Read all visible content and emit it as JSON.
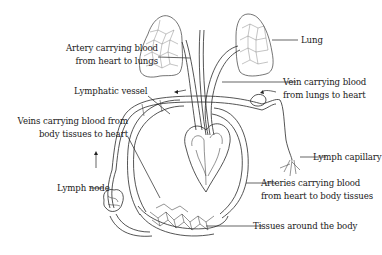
{
  "diagram": {
    "labels": {
      "artery_to_lungs": [
        "Artery carrying blood",
        "from heart to lungs"
      ],
      "lung": "Lung",
      "vein_from_lungs": [
        "Vein carrying blood",
        "from lungs to heart"
      ],
      "lymphatic_vessel": "Lymphatic vessel",
      "veins_to_heart": [
        "Veins carrying blood from",
        "body tissues to heart"
      ],
      "lymph_capillary": "Lymph capillary",
      "lymph_node": "Lymph node",
      "arteries_to_body": [
        "Arteries carrying blood",
        "from heart to body tissues"
      ],
      "tissues": "Tissues around the body"
    },
    "colors": {
      "line": "#2a2a2a",
      "text": "#1a1a1a",
      "background": "#ffffff"
    }
  }
}
